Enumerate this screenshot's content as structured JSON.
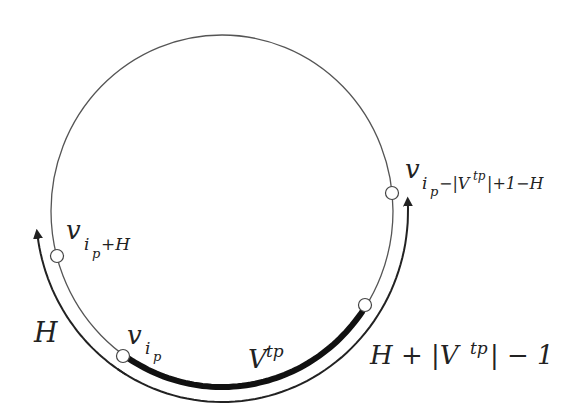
{
  "diagram": {
    "type": "cycle-diagram",
    "nodes": [
      {
        "id": "v_ip_plus_H",
        "label_base": "v",
        "label_sub": "i",
        "label_subsub": "p",
        "label_sub_tail": "+H"
      },
      {
        "id": "v_ip",
        "label_base": "v",
        "label_sub": "i",
        "label_subsub": "p"
      },
      {
        "id": "v_end_Vtp",
        "label": "unlabeled node"
      },
      {
        "id": "v_ip_minus",
        "label_base": "v",
        "label_sub": "i",
        "label_subsub": "p",
        "label_sub_tail": "−|V",
        "label_sub_sup": "tp",
        "label_sub_tail2": "|+1−H"
      }
    ],
    "arc_labels": {
      "thick_arc": {
        "base": "V",
        "sup": "tp"
      },
      "left_arrow": {
        "text": "H"
      },
      "right_arrow": {
        "prefix": "H + |V",
        "sup": "tp",
        "suffix": "| − 1"
      }
    },
    "colors": {
      "circle": "#555555",
      "thick_arc": "#111111",
      "arrow": "#222222",
      "node_fill": "#ffffff",
      "text": "#222222"
    }
  }
}
